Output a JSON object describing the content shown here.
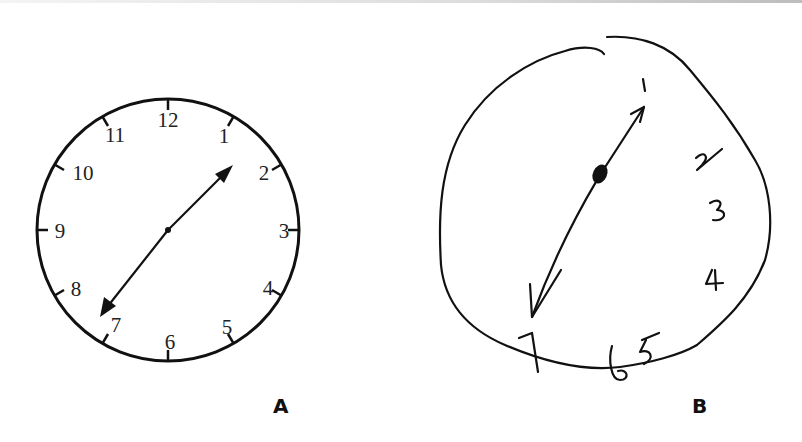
{
  "figure": {
    "panels": [
      {
        "id": "A",
        "label": "A",
        "description": "Normal printed clock face, hands pointing toward 2 and 7",
        "numerals": [
          "12",
          "1",
          "2",
          "3",
          "4",
          "5",
          "6",
          "7",
          "8",
          "9",
          "10",
          "11"
        ],
        "hands_point_to": [
          "2",
          "7"
        ]
      },
      {
        "id": "B",
        "label": "B",
        "description": "Hand-drawn irregular clock, numbers crowded on right side, 8-12 missing",
        "numerals": [
          "1",
          "2",
          "3",
          "4",
          "5",
          "6",
          "7"
        ],
        "hands_point_to": [
          "1",
          "7"
        ]
      }
    ]
  },
  "colors": {
    "ink": "#111111",
    "background": "#ffffff"
  }
}
